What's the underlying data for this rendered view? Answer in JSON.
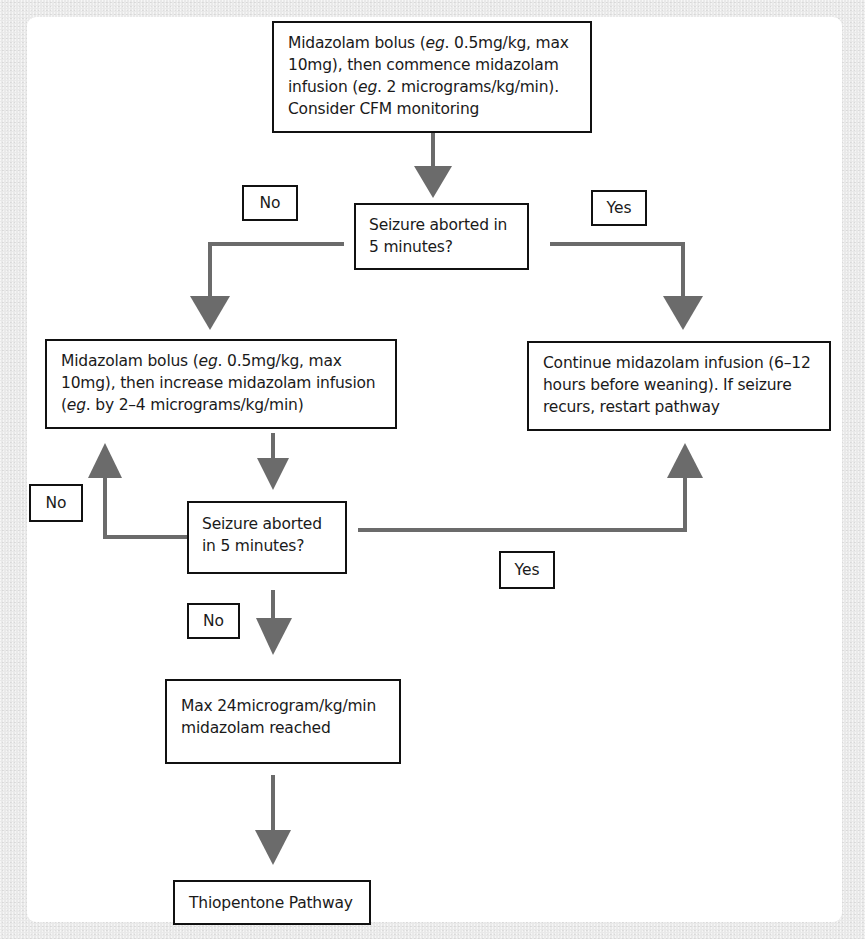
{
  "diagram": {
    "type": "flowchart",
    "colors": {
      "arrow": "#6b6b6b",
      "box_border": "#111111",
      "panel": "#ffffff",
      "background": "#e9e9e9"
    },
    "nodes": {
      "start": {
        "line1_a": "Midazolam bolus (",
        "line1_em": "eg",
        "line1_b": ". 0.5mg/kg, max",
        "line2": "10mg), then commence midazolam",
        "line3_a": "infusion (",
        "line3_em": "eg",
        "line3_b": ". 2 micrograms/kg/min).",
        "line4": "Consider CFM monitoring"
      },
      "decision1": {
        "line1": "Seizure aborted in",
        "line2": "5 minutes?"
      },
      "increase": {
        "line1_a": "Midazolam bolus (",
        "line1_em": "eg",
        "line1_b": ". 0.5mg/kg, max",
        "line2": "10mg), then increase midazolam infusion",
        "line3_a": "(",
        "line3_em": "eg",
        "line3_b": ". by 2–4 micrograms/kg/min)"
      },
      "continue": {
        "line1": "Continue midazolam infusion (6–12",
        "line2": "hours before weaning). If seizure",
        "line3": "recurs, restart pathway"
      },
      "decision2": {
        "line1": "Seizure aborted",
        "line2": "in 5 minutes?"
      },
      "max": {
        "line1": "Max 24microgram/kg/min",
        "line2": "midazolam reached"
      },
      "thiopentone": {
        "text": "Thiopentone Pathway"
      }
    },
    "edge_labels": {
      "d1_no": "No",
      "d1_yes": "Yes",
      "d2_no_loop": "No",
      "d2_yes": "Yes",
      "d2_no_down": "No"
    }
  }
}
